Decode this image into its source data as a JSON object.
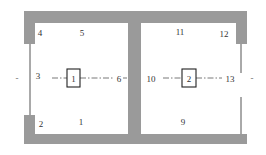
{
  "diagram": {
    "type": "two-room floor plan",
    "colors": {
      "wall": "#9a9a9a",
      "line": "#555555",
      "text": "#333333"
    },
    "rooms": [
      {
        "id": "room-left",
        "box_label": "1"
      },
      {
        "id": "room-right",
        "box_label": "2"
      }
    ],
    "labels": {
      "l1": "1",
      "l2": "2",
      "l3": "3",
      "l4": "4",
      "l5": "5",
      "l6": "6",
      "l9": "9",
      "l10": "10",
      "l11": "11",
      "l12": "12",
      "l13": "13"
    },
    "boxes": {
      "b1": "1",
      "b2": "2"
    },
    "edge_marks": {
      "left": "-",
      "right": "-"
    }
  }
}
